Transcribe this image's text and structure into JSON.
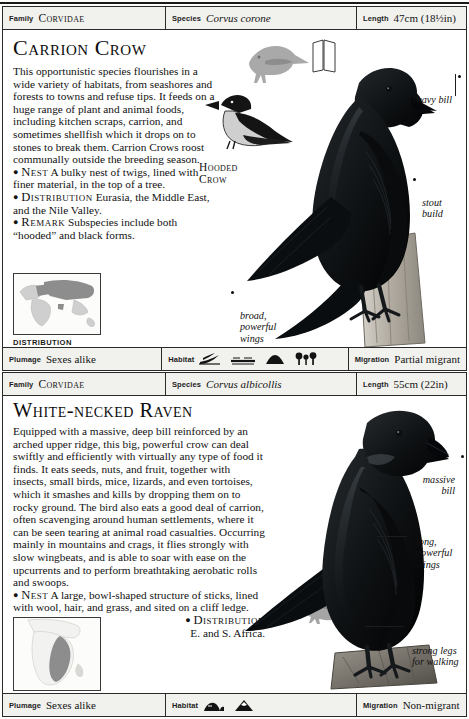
{
  "page": {
    "background": "#fdfdfb",
    "ink": "#121212"
  },
  "entries": [
    {
      "header": {
        "family_label": "Family",
        "family_value": "Corvidae",
        "species_label": "Species",
        "species_value": "Corvus corone",
        "length_label": "Length",
        "length_value": "47cm (18½in)"
      },
      "title": "Carrion Crow",
      "text_paragraphs": [
        "This opportunistic species flourishes in a wide variety of habitats, from seashores and forests to towns and refuse tips. It feeds on a huge range of plant and animal foods, including kitchen scraps, carrion, and sometimes shellfish which it drops on to stones to break them. Carrion Crows roost communally outside the breeding season."
      ],
      "facts": [
        {
          "key": "Nest",
          "value": "A bulky nest of twigs, lined with finer material, in the top of a tree."
        },
        {
          "key": "Distribution",
          "value": "Eurasia, the Middle East, and the Nile Valley."
        },
        {
          "key": "Remark",
          "value": "Subspecies include both “hooded” and black forms."
        }
      ],
      "map_caption": "DISTRIBUTION",
      "map_region": "eurasia",
      "sub_caption": "Hooded\nCrow",
      "annotations": [
        {
          "name": "heavy-bill",
          "text": "heavy bill"
        },
        {
          "name": "stout-build",
          "text": "stout\nbuild"
        },
        {
          "name": "broad-powerful-wings",
          "text": "broad,\npowerful\nwings"
        }
      ],
      "footer": {
        "plumage_label": "Plumage",
        "plumage_value": "Sexes alike",
        "habitat_label": "Habitat",
        "habitat_icons": [
          "reeds-icon",
          "shoreline-icon",
          "hill-icon",
          "trees-icon"
        ],
        "migration_label": "Migration",
        "migration_value": "Partial migrant"
      }
    },
    {
      "header": {
        "family_label": "Family",
        "family_value": "Corvidae",
        "species_label": "Species",
        "species_value": "Corvus albicollis",
        "length_label": "Length",
        "length_value": "55cm (22in)"
      },
      "title": "White-necked Raven",
      "text_paragraphs": [
        "Equipped with a massive, deep bill reinforced by an arched upper ridge, this big, powerful crow can deal swiftly and efficiently with virtually any type of food it finds. It eats seeds, nuts, and fruit, together with insects, small birds, mice, lizards, and even tortoises, which it smashes and kills by dropping them on to rocky ground. The bird also eats a good deal of carrion, often scavenging around human settlements, where it can be seen tearing at animal road casualties. Occurring mainly in mountains and crags, it flies strongly with slow wingbeats, and is able to soar with ease on the upcurrents and to perform breathtaking aerobatic rolls and swoops."
      ],
      "facts": [
        {
          "key": "Nest",
          "value": "A large, bowl-shaped structure of sticks, lined with wool, hair, and grass, and sited on a cliff ledge."
        },
        {
          "key": "Distribution",
          "value": "E. and S. Africa."
        }
      ],
      "map_caption": "DISTRIBUTION",
      "map_region": "africa",
      "annotations": [
        {
          "name": "massive-bill",
          "text": "massive\nbill"
        },
        {
          "name": "long-powerful-wings",
          "text": "long,\npowerful\nwings"
        },
        {
          "name": "strong-legs-for-walking",
          "text": "strong legs\nfor walking"
        }
      ],
      "footer": {
        "plumage_label": "Plumage",
        "plumage_value": "Sexes alike",
        "habitat_label": "Habitat",
        "habitat_icons": [
          "rock-outcrop-icon",
          "mountain-icon"
        ],
        "migration_label": "Migration",
        "migration_value": "Non-migrant"
      }
    }
  ]
}
